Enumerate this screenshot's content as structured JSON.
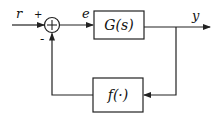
{
  "diagram": {
    "type": "feedback-control-block-diagram",
    "signals": {
      "reference": "r",
      "error": "e",
      "output": "y"
    },
    "summing_junction": {
      "plus_sign": "+",
      "minus_sign": "-"
    },
    "blocks": {
      "plant": "G(s)",
      "feedback": "f(·)"
    },
    "colors": {
      "stroke": "#222222",
      "background": "#ffffff"
    }
  }
}
